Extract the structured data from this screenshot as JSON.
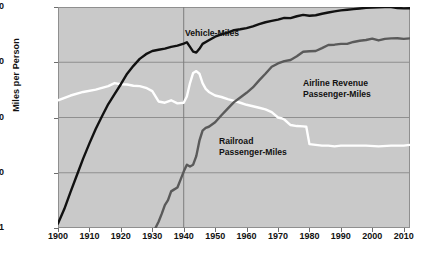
{
  "chart_data": {
    "type": "line",
    "title": "",
    "subtitle": "",
    "xlabel": "",
    "ylabel": "Miles per Person",
    "yscale": "log",
    "ylim": [
      1,
      10000
    ],
    "xlim": [
      1900,
      2012
    ],
    "ytick_labels": [
      "10000",
      "1000",
      "100",
      "10",
      "1"
    ],
    "ytick_values": [
      10000,
      1000,
      100,
      10,
      1
    ],
    "xtick_labels": [
      "1900",
      "1910",
      "1920",
      "1930",
      "1940",
      "1950",
      "1960",
      "1970",
      "1980",
      "1990",
      "2000",
      "2010"
    ],
    "xtick_values": [
      1900,
      1910,
      1920,
      1930,
      1940,
      1950,
      1960,
      1970,
      1980,
      1990,
      2000,
      2010
    ],
    "grid": true,
    "gridlines_x": [
      1940
    ],
    "legend_position": "inline-annotations",
    "plot_background": "#c9c9c9",
    "gridline_color": "#8f8f8f",
    "series": [
      {
        "name": "Vehicle-Miles",
        "color": "#111111",
        "label_text": "Vehicle-Miles",
        "x": [
          1900,
          1902,
          1904,
          1906,
          1908,
          1910,
          1912,
          1914,
          1916,
          1918,
          1920,
          1922,
          1924,
          1926,
          1928,
          1930,
          1932,
          1934,
          1936,
          1938,
          1940,
          1941,
          1942,
          1943,
          1944,
          1945,
          1946,
          1948,
          1950,
          1952,
          1954,
          1956,
          1958,
          1960,
          1962,
          1964,
          1966,
          1968,
          1970,
          1972,
          1974,
          1976,
          1978,
          1980,
          1982,
          1984,
          1986,
          1988,
          1990,
          1992,
          1994,
          1996,
          1998,
          2000,
          2002,
          2004,
          2006,
          2008,
          2010,
          2012
        ],
        "y": [
          1.2,
          2.2,
          4.5,
          9,
          18,
          34,
          62,
          105,
          175,
          265,
          400,
          620,
          860,
          1150,
          1400,
          1600,
          1680,
          1760,
          1900,
          2000,
          2180,
          2300,
          1900,
          1560,
          1500,
          1750,
          2150,
          2500,
          2900,
          3200,
          3450,
          3800,
          3950,
          4150,
          4450,
          4900,
          5300,
          5600,
          5900,
          6350,
          6300,
          6800,
          7200,
          6950,
          7100,
          7550,
          7950,
          8350,
          8700,
          8900,
          9150,
          9400,
          9650,
          9800,
          9900,
          9950,
          10000,
          9600,
          9450,
          9500
        ]
      },
      {
        "name": "Railroad Passenger-Miles",
        "color": "#ffffff",
        "label_text": "Railroad\nPassenger-Miles",
        "x": [
          1900,
          1904,
          1908,
          1912,
          1916,
          1918,
          1920,
          1922,
          1924,
          1926,
          1928,
          1930,
          1932,
          1934,
          1936,
          1938,
          1940,
          1941,
          1942,
          1943,
          1944,
          1945,
          1946,
          1947,
          1948,
          1950,
          1952,
          1954,
          1956,
          1958,
          1960,
          1962,
          1964,
          1966,
          1968,
          1970,
          1971,
          1972,
          1974,
          1976,
          1978,
          1979,
          1980,
          1982,
          1984,
          1986,
          1988,
          1990,
          1994,
          1998,
          2002,
          2006,
          2010,
          2012
        ],
        "y": [
          205,
          250,
          290,
          320,
          370,
          420,
          400,
          395,
          375,
          370,
          345,
          300,
          195,
          185,
          205,
          180,
          185,
          240,
          420,
          640,
          690,
          620,
          420,
          330,
          290,
          250,
          235,
          215,
          200,
          185,
          170,
          160,
          150,
          140,
          125,
          100,
          97,
          92,
          73,
          70,
          69,
          68,
          33,
          32,
          31,
          31,
          30,
          31,
          31,
          31,
          30,
          31,
          31,
          32
        ]
      },
      {
        "name": "Airline Revenue Passenger-Miles",
        "color": "#5a5a5a",
        "label_text": "Airline Revenue\nPassenger-Miles",
        "x": [
          1931,
          1932,
          1933,
          1934,
          1935,
          1936,
          1937,
          1938,
          1939,
          1940,
          1941,
          1942,
          1943,
          1944,
          1945,
          1946,
          1947,
          1948,
          1950,
          1952,
          1954,
          1956,
          1958,
          1960,
          1962,
          1964,
          1966,
          1968,
          1970,
          1972,
          1974,
          1976,
          1978,
          1980,
          1982,
          1984,
          1986,
          1988,
          1990,
          1992,
          1994,
          1996,
          1998,
          2000,
          2002,
          2004,
          2006,
          2008,
          2010,
          2012
        ],
        "y": [
          1.0,
          1.3,
          1.8,
          2.6,
          3.2,
          4.6,
          5.0,
          5.4,
          7.5,
          10.5,
          14,
          13,
          14,
          20,
          38,
          58,
          65,
          68,
          82,
          110,
          145,
          190,
          230,
          280,
          350,
          470,
          620,
          830,
          950,
          1050,
          1100,
          1280,
          1550,
          1580,
          1600,
          1800,
          2050,
          2080,
          2150,
          2150,
          2330,
          2450,
          2530,
          2680,
          2480,
          2650,
          2700,
          2720,
          2650,
          2700
        ]
      }
    ]
  }
}
